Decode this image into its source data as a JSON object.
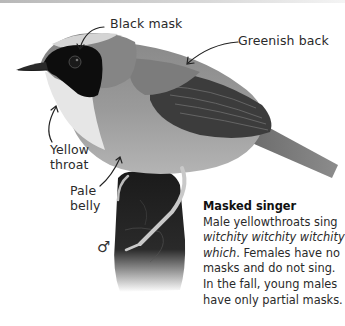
{
  "illustration": {
    "subject": "masked-yellowthroat-bird",
    "sex_symbol": "♂"
  },
  "callouts": {
    "black_mask": "Black mask",
    "greenish_back": "Greenish back",
    "yellow_throat_line1": "Yellow",
    "yellow_throat_line2": "throat",
    "pale_belly_line1": "Pale",
    "pale_belly_line2": "belly"
  },
  "caption": {
    "title": "Masked singer",
    "text_1": "Male yellowthroats sing ",
    "song": "witchity witchity witchity which",
    "text_2": ". Females have no masks and do not sing. In the fall, young males have only partial masks."
  },
  "colors": {
    "text": "#2a2a2a",
    "background": "#ffffff"
  }
}
